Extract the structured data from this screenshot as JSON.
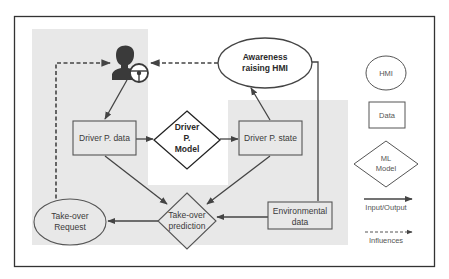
{
  "diagram": {
    "colors": {
      "background": "#ffffff",
      "frame": "#333333",
      "shaded_region": "#e8e8e8",
      "node_stroke": "#555555",
      "arrow": "#444444",
      "icon": "#3a3a3a"
    },
    "nodes": {
      "driver": {
        "label": "Driver",
        "type": "icon",
        "icon": "driver-with-steering-wheel-icon"
      },
      "awareness_hmi": {
        "type": "hmi",
        "line1": "Awareness",
        "line2": "raising HMI"
      },
      "driver_p_data": {
        "type": "data",
        "label": "Driver P. data"
      },
      "driver_p_model": {
        "type": "ml_model",
        "line1": "Driver",
        "line2": "P.",
        "line3": "Model"
      },
      "driver_p_state": {
        "type": "data",
        "label": "Driver P. state"
      },
      "takeover_request": {
        "type": "hmi",
        "line1": "Take-over",
        "line2": "Request"
      },
      "takeover_prediction": {
        "type": "ml_model",
        "line1": "Take-over",
        "line2": "prediction"
      },
      "environmental_data": {
        "type": "data",
        "line1": "Environmental",
        "line2": "data"
      }
    },
    "edges": [
      {
        "from": "driver",
        "to": "driver_p_data",
        "kind": "input_output"
      },
      {
        "from": "driver_p_data",
        "to": "driver_p_model",
        "kind": "input_output"
      },
      {
        "from": "driver_p_model",
        "to": "driver_p_state",
        "kind": "input_output"
      },
      {
        "from": "driver_p_state",
        "to": "awareness_hmi",
        "kind": "input_output"
      },
      {
        "from": "driver_p_data",
        "to": "takeover_prediction",
        "kind": "input_output"
      },
      {
        "from": "driver_p_state",
        "to": "takeover_prediction",
        "kind": "input_output"
      },
      {
        "from": "environmental_data",
        "to": "takeover_prediction",
        "kind": "input_output"
      },
      {
        "from": "environmental_data",
        "to": "awareness_hmi",
        "kind": "input_output"
      },
      {
        "from": "takeover_prediction",
        "to": "takeover_request",
        "kind": "input_output"
      },
      {
        "from": "awareness_hmi",
        "to": "driver",
        "kind": "influences"
      },
      {
        "from": "takeover_request",
        "to": "driver",
        "kind": "influences"
      }
    ],
    "legend": {
      "hmi": "HMI",
      "data": "Data",
      "ml_model_line1": "ML",
      "ml_model_line2": "Model",
      "input_output": "Input/Output",
      "influences": "Influences"
    }
  }
}
